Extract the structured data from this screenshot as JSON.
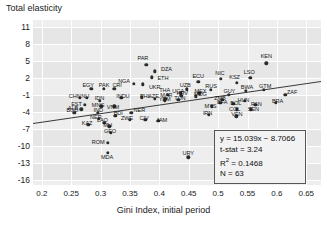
{
  "chart_data": {
    "type": "scatter",
    "title": "",
    "ylabel": "Total elasticity",
    "xlabel": "Gini Index, initial period",
    "xlim": [
      0.185,
      0.675
    ],
    "ylim": [
      -16.8,
      12.2
    ],
    "xticks": [
      "0.2",
      "0.25",
      "0.3",
      "0.35",
      "0.4",
      "0.45",
      "0.5",
      "0.55",
      "0.6",
      "0.65"
    ],
    "xtick_values": [
      0.2,
      0.25,
      0.3,
      0.35,
      0.4,
      0.45,
      0.5,
      0.55,
      0.6,
      0.65
    ],
    "yticks": [
      "11",
      "8",
      "5",
      "2",
      "-1",
      "-4",
      "-7",
      "-10",
      "-13",
      "-16"
    ],
    "ytick_values": [
      11,
      8,
      5,
      2,
      -1,
      -4,
      -7,
      -10,
      -13,
      -16
    ],
    "grid": true,
    "legend": "none",
    "regression": {
      "slope": 15.039,
      "intercept": -8.7066,
      "x_start": 0.185,
      "x_end": 0.675
    },
    "points": [
      {
        "label": "PAR",
        "x": 0.378,
        "y": 4.3,
        "lx": 0.372,
        "ly": 5.6
      },
      {
        "label": "DZA",
        "x": 0.392,
        "y": 3.2,
        "lx": 0.412,
        "ly": 3.6
      },
      {
        "label": "ETH",
        "x": 0.387,
        "y": 2.1,
        "lx": 0.406,
        "ly": 2.0
      },
      {
        "label": "KEN",
        "x": 0.582,
        "y": 4.6,
        "lx": 0.582,
        "ly": 5.9
      },
      {
        "label": "NGA",
        "x": 0.357,
        "y": 1.0,
        "lx": 0.34,
        "ly": 1.5
      },
      {
        "label": "UKR",
        "x": 0.372,
        "y": 0.9,
        "lx": 0.392,
        "ly": 0.4
      },
      {
        "label": "NIC",
        "x": 0.505,
        "y": 1.9,
        "lx": 0.503,
        "ly": 2.9
      },
      {
        "label": "LSO",
        "x": 0.555,
        "y": 2.0,
        "lx": 0.553,
        "ly": 3.1
      },
      {
        "label": "KSZ",
        "x": 0.532,
        "y": 1.2,
        "lx": 0.528,
        "ly": 2.1
      },
      {
        "label": "ECU",
        "x": 0.466,
        "y": 1.3,
        "lx": 0.466,
        "ly": 2.4
      },
      {
        "label": "EGY",
        "x": 0.284,
        "y": 0.1,
        "lx": 0.279,
        "ly": 0.7
      },
      {
        "label": "PAK",
        "x": 0.305,
        "y": 0.1,
        "lx": 0.306,
        "ly": 0.7
      },
      {
        "label": "CRI",
        "x": 0.323,
        "y": 0.1,
        "lx": 0.328,
        "ly": 0.7
      },
      {
        "label": "UZB",
        "x": 0.447,
        "y": 0.0,
        "lx": 0.444,
        "ly": 0.7
      },
      {
        "label": "UGA",
        "x": 0.436,
        "y": -0.7,
        "lx": 0.432,
        "ly": -0.2
      },
      {
        "label": "MEX",
        "x": 0.468,
        "y": -0.7,
        "lx": 0.47,
        "ly": -0.2
      },
      {
        "label": "RUS",
        "x": 0.488,
        "y": -0.1,
        "lx": 0.488,
        "ly": 0.6
      },
      {
        "label": "BWA",
        "x": 0.547,
        "y": -0.2,
        "lx": 0.549,
        "ly": 0.5
      },
      {
        "label": "GTM",
        "x": 0.578,
        "y": -0.1,
        "lx": 0.58,
        "ly": 0.6
      },
      {
        "label": "ZAF",
        "x": 0.614,
        "y": -1.0,
        "lx": 0.626,
        "ly": -0.4
      },
      {
        "label": "GUY",
        "x": 0.518,
        "y": -0.9,
        "lx": 0.519,
        "ly": -0.3
      },
      {
        "label": "CHN",
        "x": 0.265,
        "y": -1.5,
        "lx": 0.256,
        "ly": -1.2
      },
      {
        "label": "NU",
        "x": 0.277,
        "y": -1.5,
        "lx": 0.274,
        "ly": -1.2
      },
      {
        "label": "IDN",
        "x": 0.299,
        "y": -2.0,
        "lx": 0.298,
        "ly": -1.5
      },
      {
        "label": "INDU",
        "x": 0.335,
        "y": -1.5,
        "lx": 0.338,
        "ly": -1.2
      },
      {
        "label": "PHL",
        "x": 0.37,
        "y": -1.4,
        "lx": 0.376,
        "ly": -1.2
      },
      {
        "label": "THA",
        "x": 0.414,
        "y": -0.9,
        "lx": 0.409,
        "ly": -0.1
      },
      {
        "label": "AZE",
        "x": 0.392,
        "y": -1.6,
        "lx": 0.39,
        "ly": -1.1
      },
      {
        "label": "MAR",
        "x": 0.41,
        "y": -1.6,
        "lx": 0.412,
        "ly": -1.0
      },
      {
        "label": "YEM",
        "x": 0.409,
        "y": -2.0,
        "lx": 0.409,
        "ly": -1.7
      },
      {
        "label": "TUN",
        "x": 0.432,
        "y": -1.8,
        "lx": 0.435,
        "ly": -1.5
      },
      {
        "label": "HRV",
        "x": 0.437,
        "y": -1.1,
        "lx": 0.439,
        "ly": -0.7
      },
      {
        "label": "MDG",
        "x": 0.462,
        "y": -1.2,
        "lx": 0.47,
        "ly": -0.8
      },
      {
        "label": "EST",
        "x": 0.273,
        "y": -2.7,
        "lx": 0.259,
        "ly": -2.5
      },
      {
        "label": "ALB",
        "x": 0.267,
        "y": -3.5,
        "lx": 0.253,
        "ly": -3.3
      },
      {
        "label": "MNG",
        "x": 0.301,
        "y": -3.0,
        "lx": 0.296,
        "ly": -2.8
      },
      {
        "label": "VNM",
        "x": 0.323,
        "y": -3.0,
        "lx": 0.321,
        "ly": -3.1
      },
      {
        "label": "ZMB",
        "x": 0.507,
        "y": -1.8,
        "lx": 0.503,
        "ly": -1.5
      },
      {
        "label": "BFA",
        "x": 0.504,
        "y": -2.4,
        "lx": 0.507,
        "ly": -2.2
      },
      {
        "label": "BOL",
        "x": 0.526,
        "y": -2.5,
        "lx": 0.53,
        "ly": -2.3
      },
      {
        "label": "HUN",
        "x": 0.545,
        "y": -2.0,
        "lx": 0.543,
        "ly": -1.8
      },
      {
        "label": "PAN",
        "x": 0.563,
        "y": -2.7,
        "lx": 0.565,
        "ly": -2.5
      },
      {
        "label": "BRA",
        "x": 0.598,
        "y": -2.3,
        "lx": 0.601,
        "ly": -2.1
      },
      {
        "label": "MYS",
        "x": 0.489,
        "y": -3.0,
        "lx": 0.487,
        "ly": -2.9
      },
      {
        "label": "COL",
        "x": 0.532,
        "y": -3.5,
        "lx": 0.528,
        "ly": -3.4
      },
      {
        "label": "SEN",
        "x": 0.556,
        "y": -3.5,
        "lx": 0.56,
        "ly": -3.4
      },
      {
        "label": "VEN",
        "x": 0.531,
        "y": -4.7,
        "lx": 0.532,
        "ly": -4.4
      },
      {
        "label": "IRN",
        "x": 0.484,
        "y": -4.5,
        "lx": 0.482,
        "ly": -4.2
      },
      {
        "label": "BGD",
        "x": 0.255,
        "y": -4.1,
        "lx": 0.252,
        "ly": -3.6
      },
      {
        "label": "IND",
        "x": 0.295,
        "y": -4.1,
        "lx": 0.296,
        "ly": -3.6
      },
      {
        "label": "BDI",
        "x": 0.325,
        "y": -4.6,
        "lx": 0.33,
        "ly": -4.2
      },
      {
        "label": "NER",
        "x": 0.352,
        "y": -4.1,
        "lx": 0.366,
        "ly": -3.7
      },
      {
        "label": "NER2",
        "x": 0.297,
        "y": -5.2,
        "lx": 0.292,
        "ly": -4.8
      },
      {
        "label": "ZWE",
        "x": 0.35,
        "y": -5.3,
        "lx": 0.345,
        "ly": -5.0
      },
      {
        "label": "CIV",
        "x": 0.376,
        "y": -5.3,
        "lx": 0.374,
        "ly": -5.0
      },
      {
        "label": "JAM",
        "x": 0.398,
        "y": -5.5,
        "lx": 0.404,
        "ly": -5.3
      },
      {
        "label": "LAO",
        "x": 0.306,
        "y": -5.9,
        "lx": 0.303,
        "ly": -5.4
      },
      {
        "label": "KAZ",
        "x": 0.279,
        "y": -6.2,
        "lx": 0.277,
        "ly": -5.9
      },
      {
        "label": "MLI",
        "x": 0.315,
        "y": -6.5,
        "lx": 0.312,
        "ly": -6.2
      },
      {
        "label": "GEO",
        "x": 0.317,
        "y": -7.6,
        "lx": 0.316,
        "ly": -7.3
      },
      {
        "label": "ROM",
        "x": 0.312,
        "y": -9.4,
        "lx": 0.296,
        "ly": -9.2
      },
      {
        "label": "MDA",
        "x": 0.312,
        "y": -11.1,
        "lx": 0.311,
        "ly": -11.8
      },
      {
        "label": "URY",
        "x": 0.449,
        "y": -11.9,
        "lx": 0.449,
        "ly": -11.2
      }
    ]
  },
  "stats": {
    "equation": "y = 15.039x − 8.7066",
    "tstat": "t-stat = 3.24",
    "r2_prefix": "R",
    "r2_sup": "2",
    "r2_value": " = 0.1468",
    "n": "N = 63"
  }
}
